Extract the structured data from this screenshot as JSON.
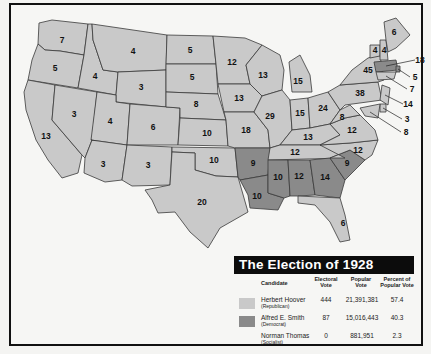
{
  "title": "The Election of 1928",
  "colors": {
    "republican": "#c9c9c9",
    "democrat": "#8a8a8a",
    "border": "#3a3a3a",
    "background": "#f6f6f4",
    "title_bar": "#0c0c0c"
  },
  "legend": {
    "headers": {
      "candidate": "Candidate",
      "electoral": "Electoral Vote",
      "popular": "Popular Vote",
      "percent": "Percent of Popular Vote"
    },
    "rows": [
      {
        "candidate": "Herbert Hoover",
        "party": "(Republican)",
        "electoral": "444",
        "popular": "21,391,381",
        "percent": "57.4",
        "swatch": "republican"
      },
      {
        "candidate": "Alfred E. Smith",
        "party": "(Democrat)",
        "electoral": "87",
        "popular": "15,016,443",
        "percent": "40.3",
        "swatch": "democrat"
      },
      {
        "candidate": "Norman Thomas",
        "party": "(Socialist)",
        "electoral": "0",
        "popular": "881,951",
        "percent": "2.3",
        "swatch": "none"
      }
    ]
  },
  "states": [
    {
      "name": "Washington",
      "votes": "7",
      "winner": "republican"
    },
    {
      "name": "Oregon",
      "votes": "5",
      "winner": "republican"
    },
    {
      "name": "California",
      "votes": "13",
      "winner": "republican"
    },
    {
      "name": "Idaho",
      "votes": "4",
      "winner": "republican"
    },
    {
      "name": "Nevada",
      "votes": "3",
      "winner": "republican"
    },
    {
      "name": "Montana",
      "votes": "4",
      "winner": "republican"
    },
    {
      "name": "Wyoming",
      "votes": "3",
      "winner": "republican"
    },
    {
      "name": "Utah",
      "votes": "4",
      "winner": "republican"
    },
    {
      "name": "Arizona",
      "votes": "3",
      "winner": "republican"
    },
    {
      "name": "Colorado",
      "votes": "6",
      "winner": "republican"
    },
    {
      "name": "New Mexico",
      "votes": "3",
      "winner": "republican"
    },
    {
      "name": "North Dakota",
      "votes": "5",
      "winner": "republican"
    },
    {
      "name": "South Dakota",
      "votes": "5",
      "winner": "republican"
    },
    {
      "name": "Nebraska",
      "votes": "8",
      "winner": "republican"
    },
    {
      "name": "Kansas",
      "votes": "10",
      "winner": "republican"
    },
    {
      "name": "Oklahoma",
      "votes": "10",
      "winner": "republican"
    },
    {
      "name": "Texas",
      "votes": "20",
      "winner": "republican"
    },
    {
      "name": "Minnesota",
      "votes": "12",
      "winner": "republican"
    },
    {
      "name": "Iowa",
      "votes": "13",
      "winner": "republican"
    },
    {
      "name": "Missouri",
      "votes": "18",
      "winner": "republican"
    },
    {
      "name": "Arkansas",
      "votes": "9",
      "winner": "democrat"
    },
    {
      "name": "Louisiana",
      "votes": "10",
      "winner": "democrat"
    },
    {
      "name": "Wisconsin",
      "votes": "13",
      "winner": "republican"
    },
    {
      "name": "Illinois",
      "votes": "29",
      "winner": "republican"
    },
    {
      "name": "Michigan",
      "votes": "15",
      "winner": "republican"
    },
    {
      "name": "Indiana",
      "votes": "15",
      "winner": "republican"
    },
    {
      "name": "Ohio",
      "votes": "24",
      "winner": "republican"
    },
    {
      "name": "Kentucky",
      "votes": "13",
      "winner": "republican"
    },
    {
      "name": "Tennessee",
      "votes": "12",
      "winner": "republican"
    },
    {
      "name": "Mississippi",
      "votes": "10",
      "winner": "democrat"
    },
    {
      "name": "Alabama",
      "votes": "12",
      "winner": "democrat"
    },
    {
      "name": "Georgia",
      "votes": "14",
      "winner": "democrat"
    },
    {
      "name": "Florida",
      "votes": "6",
      "winner": "republican"
    },
    {
      "name": "South Carolina",
      "votes": "9",
      "winner": "democrat"
    },
    {
      "name": "North Carolina",
      "votes": "12",
      "winner": "republican"
    },
    {
      "name": "Virginia",
      "votes": "12",
      "winner": "republican"
    },
    {
      "name": "West Virginia",
      "votes": "8",
      "winner": "republican"
    },
    {
      "name": "Pennsylvania",
      "votes": "38",
      "winner": "republican"
    },
    {
      "name": "New York",
      "votes": "45",
      "winner": "republican"
    },
    {
      "name": "Vermont",
      "votes": "4",
      "winner": "republican"
    },
    {
      "name": "New Hampshire",
      "votes": "4",
      "winner": "republican"
    },
    {
      "name": "Maine",
      "votes": "6",
      "winner": "republican"
    },
    {
      "name": "Massachusetts",
      "votes": "18",
      "winner": "democrat"
    },
    {
      "name": "Rhode Island",
      "votes": "5",
      "winner": "democrat"
    },
    {
      "name": "Connecticut",
      "votes": "7",
      "winner": "republican"
    },
    {
      "name": "New Jersey",
      "votes": "14",
      "winner": "republican"
    },
    {
      "name": "Delaware",
      "votes": "3",
      "winner": "republican"
    },
    {
      "name": "Maryland",
      "votes": "8",
      "winner": "republican"
    }
  ]
}
